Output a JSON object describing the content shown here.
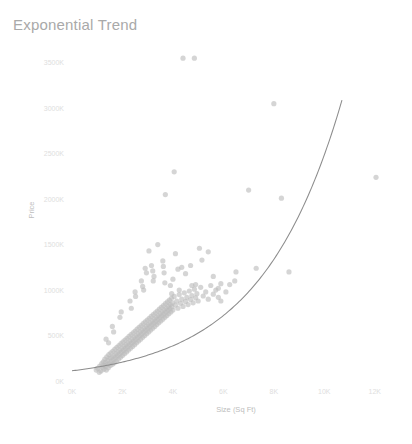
{
  "chart_data": {
    "type": "scatter",
    "title": "Exponential Trend",
    "xlabel": "Size (Sq Ft)",
    "ylabel": "Price",
    "xlim": [
      0,
      13000
    ],
    "ylim": [
      0,
      3750
    ],
    "grid": false,
    "legend": null,
    "x_ticks": [
      0,
      2000,
      4000,
      6000,
      8000,
      10000,
      12000
    ],
    "x_tick_labels": [
      "0K",
      "2K",
      "4K",
      "6K",
      "8K",
      "10K",
      "12K"
    ],
    "y_ticks": [
      0,
      500,
      1000,
      1500,
      2000,
      2500,
      3000,
      3500
    ],
    "y_tick_labels": [
      "0K",
      "500K",
      "1000K",
      "1500K",
      "2000K",
      "2500K",
      "3000K",
      "3500K"
    ],
    "y_units": "thousands",
    "series": [
      {
        "name": "Price vs Size",
        "marker": "circle",
        "color": "#bcbcbc",
        "opacity": 0.62,
        "marker_size": 5.2,
        "points": [
          [
            960,
            120
          ],
          [
            1020,
            140
          ],
          [
            1080,
            95
          ],
          [
            1100,
            165
          ],
          [
            1150,
            110
          ],
          [
            1180,
            190
          ],
          [
            1210,
            150
          ],
          [
            1240,
            210
          ],
          [
            1260,
            130
          ],
          [
            1280,
            175
          ],
          [
            1300,
            240
          ],
          [
            1320,
            160
          ],
          [
            1340,
            205
          ],
          [
            1360,
            120
          ],
          [
            1380,
            265
          ],
          [
            1400,
            180
          ],
          [
            1420,
            225
          ],
          [
            1440,
            145
          ],
          [
            1460,
            290
          ],
          [
            1480,
            195
          ],
          [
            1500,
            250
          ],
          [
            1520,
            170
          ],
          [
            1540,
            310
          ],
          [
            1560,
            215
          ],
          [
            1580,
            260
          ],
          [
            1600,
            185
          ],
          [
            1620,
            330
          ],
          [
            1640,
            235
          ],
          [
            1660,
            280
          ],
          [
            1680,
            200
          ],
          [
            1700,
            350
          ],
          [
            1720,
            255
          ],
          [
            1740,
            300
          ],
          [
            1760,
            220
          ],
          [
            1780,
            370
          ],
          [
            1800,
            275
          ],
          [
            1820,
            320
          ],
          [
            1840,
            240
          ],
          [
            1860,
            390
          ],
          [
            1880,
            295
          ],
          [
            1900,
            340
          ],
          [
            1920,
            260
          ],
          [
            1940,
            410
          ],
          [
            1960,
            315
          ],
          [
            1980,
            360
          ],
          [
            2000,
            280
          ],
          [
            2020,
            430
          ],
          [
            2040,
            335
          ],
          [
            2060,
            380
          ],
          [
            2080,
            300
          ],
          [
            2100,
            450
          ],
          [
            2120,
            355
          ],
          [
            2140,
            400
          ],
          [
            2160,
            320
          ],
          [
            2180,
            470
          ],
          [
            2200,
            375
          ],
          [
            2220,
            420
          ],
          [
            2240,
            340
          ],
          [
            2260,
            490
          ],
          [
            2280,
            395
          ],
          [
            2300,
            440
          ],
          [
            2320,
            360
          ],
          [
            2340,
            510
          ],
          [
            2360,
            415
          ],
          [
            2380,
            460
          ],
          [
            2400,
            380
          ],
          [
            2420,
            530
          ],
          [
            2440,
            435
          ],
          [
            2460,
            480
          ],
          [
            2480,
            400
          ],
          [
            2500,
            550
          ],
          [
            2520,
            455
          ],
          [
            2540,
            500
          ],
          [
            2560,
            420
          ],
          [
            2580,
            570
          ],
          [
            2600,
            475
          ],
          [
            2620,
            520
          ],
          [
            2640,
            440
          ],
          [
            2660,
            590
          ],
          [
            2680,
            495
          ],
          [
            2700,
            540
          ],
          [
            2720,
            460
          ],
          [
            2740,
            610
          ],
          [
            2760,
            515
          ],
          [
            2780,
            560
          ],
          [
            2800,
            480
          ],
          [
            2820,
            630
          ],
          [
            2840,
            535
          ],
          [
            2860,
            580
          ],
          [
            2880,
            500
          ],
          [
            2900,
            650
          ],
          [
            2920,
            555
          ],
          [
            2940,
            600
          ],
          [
            2960,
            520
          ],
          [
            2980,
            670
          ],
          [
            3000,
            575
          ],
          [
            3020,
            620
          ],
          [
            3040,
            540
          ],
          [
            3060,
            690
          ],
          [
            3080,
            595
          ],
          [
            3100,
            640
          ],
          [
            3120,
            560
          ],
          [
            3140,
            710
          ],
          [
            3160,
            615
          ],
          [
            3180,
            660
          ],
          [
            3200,
            580
          ],
          [
            3220,
            730
          ],
          [
            3240,
            635
          ],
          [
            3260,
            680
          ],
          [
            3280,
            600
          ],
          [
            3300,
            750
          ],
          [
            3320,
            655
          ],
          [
            3340,
            700
          ],
          [
            3360,
            620
          ],
          [
            3380,
            770
          ],
          [
            3400,
            675
          ],
          [
            3420,
            720
          ],
          [
            3440,
            640
          ],
          [
            3460,
            790
          ],
          [
            3480,
            695
          ],
          [
            3500,
            740
          ],
          [
            3520,
            660
          ],
          [
            3540,
            810
          ],
          [
            3560,
            715
          ],
          [
            3580,
            760
          ],
          [
            3600,
            680
          ],
          [
            3620,
            830
          ],
          [
            3640,
            735
          ],
          [
            3660,
            780
          ],
          [
            3680,
            700
          ],
          [
            3700,
            850
          ],
          [
            3720,
            755
          ],
          [
            3740,
            800
          ],
          [
            3760,
            720
          ],
          [
            3780,
            870
          ],
          [
            3800,
            775
          ],
          [
            3820,
            820
          ],
          [
            3840,
            740
          ],
          [
            3860,
            890
          ],
          [
            3880,
            795
          ],
          [
            3900,
            840
          ],
          [
            3920,
            760
          ],
          [
            3940,
            910
          ],
          [
            3960,
            815
          ],
          [
            3980,
            860
          ],
          [
            4000,
            780
          ],
          [
            4050,
            930
          ],
          [
            4100,
            835
          ],
          [
            4150,
            880
          ],
          [
            4200,
            800
          ],
          [
            4250,
            950
          ],
          [
            4300,
            855
          ],
          [
            4350,
            900
          ],
          [
            4400,
            820
          ],
          [
            4450,
            970
          ],
          [
            4500,
            875
          ],
          [
            4550,
            920
          ],
          [
            4600,
            840
          ],
          [
            4650,
            990
          ],
          [
            4700,
            895
          ],
          [
            4750,
            940
          ],
          [
            4800,
            860
          ],
          [
            4850,
            1010
          ],
          [
            4900,
            915
          ],
          [
            4950,
            960
          ],
          [
            5000,
            880
          ],
          [
            5100,
            1030
          ],
          [
            5200,
            935
          ],
          [
            5300,
            980
          ],
          [
            5400,
            900
          ],
          [
            5500,
            1050
          ],
          [
            5600,
            955
          ],
          [
            5700,
            1000
          ],
          [
            5800,
            920
          ],
          [
            5900,
            1070
          ],
          [
            3150,
            1270
          ],
          [
            3200,
            1210
          ],
          [
            3250,
            1150
          ],
          [
            3220,
            1100
          ],
          [
            3600,
            1320
          ],
          [
            3620,
            1260
          ],
          [
            3650,
            1190
          ],
          [
            3680,
            1080
          ],
          [
            2750,
            1100
          ],
          [
            2800,
            1040
          ],
          [
            2840,
            1000
          ],
          [
            2500,
            980
          ],
          [
            2520,
            930
          ],
          [
            4100,
            1400
          ],
          [
            4200,
            1230
          ],
          [
            4350,
            1250
          ],
          [
            4500,
            1180
          ],
          [
            4700,
            1270
          ],
          [
            4750,
            1050
          ],
          [
            4900,
            1060
          ],
          [
            3400,
            1500
          ],
          [
            3050,
            1430
          ],
          [
            3700,
            2050
          ],
          [
            4050,
            2300
          ],
          [
            4400,
            3550
          ],
          [
            4850,
            3550
          ],
          [
            6450,
            1100
          ],
          [
            6500,
            1200
          ],
          [
            5400,
            1420
          ],
          [
            5600,
            1150
          ],
          [
            6100,
            980
          ],
          [
            6250,
            1060
          ],
          [
            7000,
            2100
          ],
          [
            7300,
            1240
          ],
          [
            8000,
            3050
          ],
          [
            8300,
            2010
          ],
          [
            8600,
            1200
          ],
          [
            12050,
            2240
          ],
          [
            5050,
            1460
          ],
          [
            5150,
            1330
          ],
          [
            2300,
            880
          ],
          [
            2350,
            800
          ],
          [
            1900,
            700
          ],
          [
            1950,
            760
          ],
          [
            1600,
            600
          ],
          [
            1650,
            540
          ],
          [
            1350,
            460
          ],
          [
            1450,
            420
          ],
          [
            4000,
            1120
          ],
          [
            4250,
            1000
          ],
          [
            3900,
            1050
          ],
          [
            3950,
            960
          ],
          [
            5800,
            1020
          ],
          [
            5900,
            880
          ],
          [
            2900,
            1240
          ],
          [
            2950,
            1190
          ]
        ]
      }
    ],
    "trendline": {
      "name": "Exponential fit",
      "type": "exponential",
      "color": "#8c8c8c",
      "equation_form": "y = a * exp(b * x)",
      "a": 112,
      "b": 0.00031,
      "x_start": 0,
      "x_end": 10700
    }
  }
}
